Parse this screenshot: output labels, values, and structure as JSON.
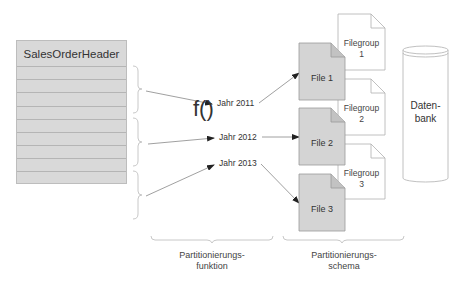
{
  "diagram": {
    "table": {
      "title": "SalesOrderHeader",
      "row_count": 9
    },
    "function": {
      "symbol": "f()"
    },
    "years": [
      {
        "label": "Jahr 2011"
      },
      {
        "label": "Jahr 2012"
      },
      {
        "label": "Jahr 2013"
      }
    ],
    "files": [
      {
        "label": "File 1"
      },
      {
        "label": "File 2"
      },
      {
        "label": "File 3"
      }
    ],
    "filegroups": [
      {
        "line1": "Filegroup",
        "line2": "1"
      },
      {
        "line1": "Filegroup",
        "line2": "2"
      },
      {
        "line1": "Filegroup",
        "line2": "3"
      }
    ],
    "database": {
      "line1": "Daten-",
      "line2": "bank"
    },
    "bottom_labels": {
      "function": {
        "line1": "Partitionierungs-",
        "line2": "funktion"
      },
      "scheme": {
        "line1": "Partitionierungs-",
        "line2": "schema"
      }
    },
    "colors": {
      "table_fill": "#d9d9d9",
      "file_fill": "#d4d4d4",
      "filegroup_fill": "#ffffff",
      "stroke": "#9e9e9e",
      "arrow": "#555555"
    }
  }
}
